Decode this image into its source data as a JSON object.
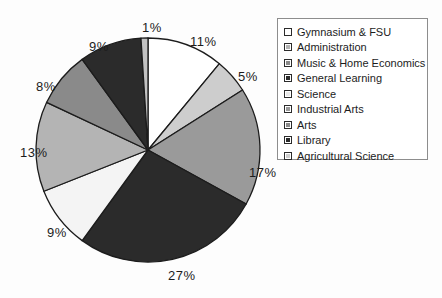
{
  "chart_data": {
    "type": "pie",
    "title": "",
    "legend_position": "right",
    "grid": false,
    "categories": [
      "Gymnasium & FSU",
      "Administration",
      "Music & Home Economics",
      "General Learning",
      "Science",
      "Industrial  Arts",
      "Arts",
      "Library",
      "Agricultural  Science"
    ],
    "values": [
      11,
      5,
      17,
      27,
      9,
      13,
      8,
      9,
      1
    ],
    "value_labels": [
      "11%",
      "5%",
      "17%",
      "27%",
      "9%",
      "13%",
      "8%",
      "9%",
      "1%"
    ],
    "colors": [
      "#ffffff",
      "#cdcdcd",
      "#9a9a9a",
      "#2b2b2b",
      "#f4f4f4",
      "#b4b4b4",
      "#8a8a8a",
      "#2b2b2b",
      "#c2c2c2"
    ],
    "slice_border_color": "#1c1c1c",
    "start_angle_deg": 0,
    "direction": "clockwise"
  },
  "legend": {
    "items": [
      {
        "label": "Gymnasium & FSU",
        "swatch": "#ffffff"
      },
      {
        "label": "Administration",
        "swatch": "#b4b4b4"
      },
      {
        "label": "Music & Home Economics",
        "swatch": "#8a8a8a"
      },
      {
        "label": "General Learning",
        "swatch": "#2b2b2b"
      },
      {
        "label": "Science",
        "swatch": "#e8e8e8"
      },
      {
        "label": "Industrial  Arts",
        "swatch": "#9a9a9a"
      },
      {
        "label": "Arts",
        "swatch": "#8a8a8a"
      },
      {
        "label": "Library",
        "swatch": "#2b2b2b"
      },
      {
        "label": "Agricultural  Science",
        "swatch": "#cdcdcd"
      }
    ]
  },
  "slice_labels": {
    "gymnasium": "11%",
    "administration": "5%",
    "music_home_economics": "17%",
    "general_learning": "27%",
    "science": "9%",
    "industrial_arts": "13%",
    "arts": "8%",
    "library": "9%",
    "agricultural_science": "1%"
  }
}
